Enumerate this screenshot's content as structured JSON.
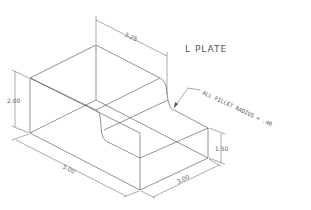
{
  "title": "L PLATE",
  "note": "ALL FILLET RADIUS = .40",
  "dimensions": {
    "top_width": "3.25",
    "height_overall": "2.00",
    "length": "5.00",
    "step_height": "1.50",
    "depth": "3.00"
  }
}
